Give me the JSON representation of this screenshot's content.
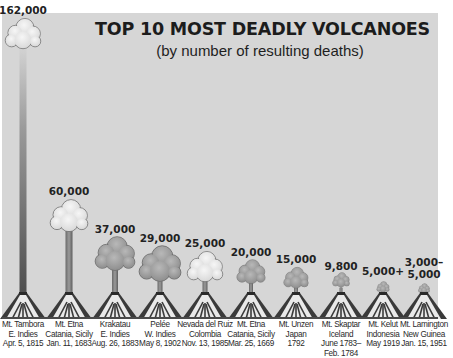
{
  "title": "TOP 10 MOST DEADLY VOLCANOES",
  "subtitle": "(by number of resulting deaths)",
  "colors": {
    "background": "#ffffff",
    "panel": "#d6d6d6",
    "text": "#1c1c1c",
    "cone_dark": "#3a3a3a",
    "cone_light": "#f2f2f2",
    "cloud": "#a8a8a8"
  },
  "volcanoes": [
    {
      "value_label": "162,000",
      "name": "Mt. Tambora",
      "location": "E. Indies",
      "date": "Apr. 5, 1815"
    },
    {
      "value_label": "60,000",
      "name": "Mt. Etna",
      "location": "Catania, Sicily",
      "date": "Jan. 11, 1683"
    },
    {
      "value_label": "37,000",
      "name": "Krakatau",
      "location": "E. Indies",
      "date": "Aug. 26, 1883"
    },
    {
      "value_label": "29,000",
      "name": "Pelée",
      "location": "W. Indies",
      "date": "May 8, 1902"
    },
    {
      "value_label": "25,000",
      "name": "Nevada del Ruiz",
      "location": "Colombia",
      "date": "Nov. 13, 1985"
    },
    {
      "value_label": "20,000",
      "name": "Mt. Etna",
      "location": "Catania, Sicily",
      "date": "Mar. 25, 1669"
    },
    {
      "value_label": "15,000",
      "name": "Mt. Unzen",
      "location": "Japan",
      "date": "1792"
    },
    {
      "value_label": "9,800",
      "name": "Mt. Skaptar",
      "location": "Iceland",
      "date": "June 1783–",
      "date2": "Feb. 1784"
    },
    {
      "value_label": "5,000+",
      "name": "Mt. Kelut",
      "location": "Indonesia",
      "date": "May 1919"
    },
    {
      "value_label_line1": "3,000–",
      "value_label": "5,000",
      "name": "Mt. Lamington",
      "location": "New Guinea",
      "date": "Jan. 15, 1951"
    }
  ],
  "chart_data": {
    "type": "bar",
    "title": "TOP 10 MOST DEADLY VOLCANOES",
    "subtitle": "(by number of resulting deaths)",
    "xlabel": "",
    "ylabel": "Deaths",
    "categories": [
      "Mt. Tambora, E. Indies, Apr. 5, 1815",
      "Mt. Etna, Catania, Sicily, Jan. 11, 1683",
      "Krakatau, E. Indies, Aug. 26, 1883",
      "Pelée, W. Indies, May 8, 1902",
      "Nevada del Ruiz, Colombia, Nov. 13, 1985",
      "Mt. Etna, Catania, Sicily, Mar. 25, 1669",
      "Mt. Unzen, Japan, 1792",
      "Mt. Skaptar, Iceland, June 1783–Feb. 1784",
      "Mt. Kelut, Indonesia, May 1919",
      "Mt. Lamington, New Guinea, Jan. 15, 1951"
    ],
    "values": [
      162000,
      60000,
      37000,
      29000,
      25000,
      20000,
      15000,
      9800,
      5000,
      5000
    ],
    "value_labels": [
      "162,000",
      "60,000",
      "37,000",
      "29,000",
      "25,000",
      "20,000",
      "15,000",
      "9,800",
      "5,000+",
      "3,000–5,000"
    ],
    "grid": false,
    "legend": null,
    "style": "pictograph (volcano eruption plume heights)"
  }
}
